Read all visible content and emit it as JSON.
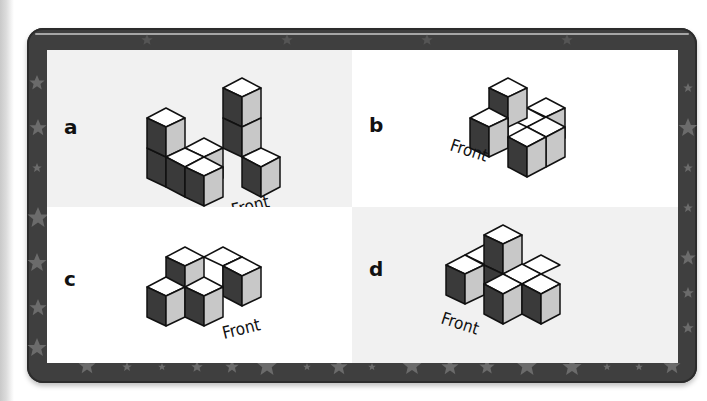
{
  "exercise": {
    "title": "Cube structures with front view indicated",
    "colors": {
      "frame": "#3f3f3f",
      "frame_star": "#6a6a6a",
      "panel_gray": "#f1f1f1",
      "panel_white": "#ffffff",
      "cube_top": "#ffffff",
      "cube_left": "#3a3a3a",
      "cube_right": "#c8c8c8",
      "outline": "#111111"
    },
    "panels": [
      {
        "id": "a",
        "label": "a",
        "front_label": "Front",
        "background": "gray",
        "cube_count": 7
      },
      {
        "id": "b",
        "label": "b",
        "front_label": "Front",
        "background": "white",
        "cube_count": 6
      },
      {
        "id": "c",
        "label": "c",
        "front_label": "Front",
        "background": "white",
        "cube_count": 5
      },
      {
        "id": "d",
        "label": "d",
        "front_label": "Front",
        "background": "gray",
        "cube_count": 6
      }
    ]
  }
}
